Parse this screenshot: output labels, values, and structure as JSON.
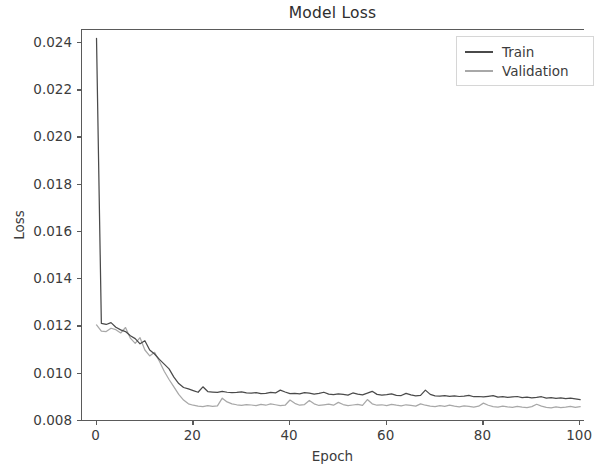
{
  "chart_data": {
    "type": "line",
    "title": "Model Loss",
    "xlabel": "Epoch",
    "ylabel": "Loss",
    "xlim": [
      -3,
      101
    ],
    "ylim": [
      0.00795,
      0.02455
    ],
    "grid": false,
    "legend_position": "upper right",
    "xticks": [
      0,
      20,
      40,
      60,
      80,
      100
    ],
    "xtick_labels": [
      "0",
      "20",
      "40",
      "60",
      "80",
      "100"
    ],
    "yticks": [
      0.008,
      0.01,
      0.012,
      0.014,
      0.016,
      0.018,
      0.02,
      0.022,
      0.024
    ],
    "ytick_labels": [
      "0.008",
      "0.010",
      "0.012",
      "0.014",
      "0.016",
      "0.018",
      "0.020",
      "0.022",
      "0.024"
    ],
    "colors": {
      "train": "#4a4a4a",
      "validation": "#a8a8a8",
      "axis": "#5a5a5a",
      "text": "#3c3c3c",
      "background": "#ffffff"
    },
    "x": [
      0,
      1,
      2,
      3,
      4,
      5,
      6,
      7,
      8,
      9,
      10,
      11,
      12,
      13,
      14,
      15,
      16,
      17,
      18,
      19,
      20,
      21,
      22,
      23,
      24,
      25,
      26,
      27,
      28,
      29,
      30,
      31,
      32,
      33,
      34,
      35,
      36,
      37,
      38,
      39,
      40,
      41,
      42,
      43,
      44,
      45,
      46,
      47,
      48,
      49,
      50,
      51,
      52,
      53,
      54,
      55,
      56,
      57,
      58,
      59,
      60,
      61,
      62,
      63,
      64,
      65,
      66,
      67,
      68,
      69,
      70,
      71,
      72,
      73,
      74,
      75,
      76,
      77,
      78,
      79,
      80,
      81,
      82,
      83,
      84,
      85,
      86,
      87,
      88,
      89,
      90,
      91,
      92,
      93,
      94,
      95,
      96,
      97,
      98,
      99,
      100
    ],
    "series": [
      {
        "name": "Train",
        "color": "#4a4a4a",
        "values": [
          0.0242,
          0.01213,
          0.01208,
          0.01216,
          0.01196,
          0.01185,
          0.01178,
          0.0116,
          0.01148,
          0.01126,
          0.01139,
          0.011,
          0.01083,
          0.0106,
          0.0104,
          0.0102,
          0.00985,
          0.00958,
          0.00941,
          0.00935,
          0.00928,
          0.00921,
          0.00944,
          0.00924,
          0.00922,
          0.0092,
          0.00925,
          0.00921,
          0.00919,
          0.0092,
          0.00923,
          0.00918,
          0.00917,
          0.00919,
          0.00915,
          0.00916,
          0.0092,
          0.00918,
          0.0093,
          0.00922,
          0.00915,
          0.00916,
          0.00914,
          0.00919,
          0.00917,
          0.00913,
          0.00916,
          0.00921,
          0.00913,
          0.00911,
          0.00914,
          0.00912,
          0.00909,
          0.00918,
          0.00913,
          0.0091,
          0.00917,
          0.00925,
          0.00912,
          0.00909,
          0.00911,
          0.00914,
          0.00908,
          0.00907,
          0.00916,
          0.0091,
          0.00906,
          0.00908,
          0.0093,
          0.00912,
          0.00906,
          0.00905,
          0.00907,
          0.00904,
          0.00906,
          0.00903,
          0.00905,
          0.00908,
          0.00902,
          0.00903,
          0.00901,
          0.00904,
          0.00907,
          0.009,
          0.00902,
          0.00899,
          0.00901,
          0.00903,
          0.00898,
          0.009,
          0.00897,
          0.00899,
          0.00902,
          0.00896,
          0.00898,
          0.00895,
          0.00897,
          0.00894,
          0.00896,
          0.00893,
          0.0089
        ]
      },
      {
        "name": "Validation",
        "color": "#a8a8a8",
        "values": [
          0.01206,
          0.0118,
          0.01178,
          0.01192,
          0.01186,
          0.01172,
          0.01195,
          0.0115,
          0.01128,
          0.01152,
          0.011,
          0.01075,
          0.0109,
          0.01052,
          0.0101,
          0.00975,
          0.00944,
          0.00912,
          0.00888,
          0.00872,
          0.00866,
          0.00862,
          0.0086,
          0.00864,
          0.00861,
          0.00863,
          0.00896,
          0.0088,
          0.00872,
          0.00868,
          0.00865,
          0.00869,
          0.00867,
          0.00864,
          0.0087,
          0.00866,
          0.00872,
          0.00868,
          0.00864,
          0.00866,
          0.00888,
          0.00874,
          0.00866,
          0.00869,
          0.00886,
          0.00872,
          0.00865,
          0.00868,
          0.00871,
          0.00866,
          0.00878,
          0.00869,
          0.00864,
          0.00867,
          0.0087,
          0.00865,
          0.0089,
          0.00872,
          0.00866,
          0.00868,
          0.00864,
          0.0087,
          0.00866,
          0.00863,
          0.00868,
          0.00865,
          0.00862,
          0.00872,
          0.00866,
          0.00862,
          0.0086,
          0.00864,
          0.00861,
          0.00866,
          0.00862,
          0.00859,
          0.00863,
          0.00861,
          0.00858,
          0.00862,
          0.00875,
          0.00866,
          0.0086,
          0.00858,
          0.00862,
          0.00859,
          0.00857,
          0.00861,
          0.00858,
          0.00856,
          0.0086,
          0.0087,
          0.00862,
          0.00857,
          0.00855,
          0.00859,
          0.00856,
          0.00858,
          0.00861,
          0.00857,
          0.0086
        ]
      }
    ]
  },
  "legend": {
    "items": [
      {
        "label": "Train"
      },
      {
        "label": "Validation"
      }
    ]
  }
}
